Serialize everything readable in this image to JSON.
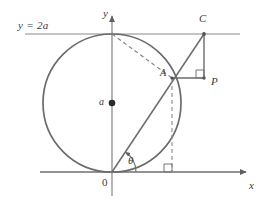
{
  "figure": {
    "type": "geometry-diagram",
    "width": 271,
    "height": 204,
    "background": "#ffffff",
    "stroke_color": "#6e6e6e",
    "axis_color": "#7a7a7a",
    "label_color": "#3a3a3a",
    "dash_color": "#8a8a8a"
  },
  "labels": {
    "line_equation": "y = 2a",
    "y_axis": "y",
    "x_axis": "x",
    "origin": "0",
    "radius": "a",
    "point_a": "A",
    "point_c": "C",
    "point_p": "P",
    "angle": "θ"
  },
  "geometry": {
    "origin": {
      "x": 112,
      "y": 172
    },
    "circle": {
      "cx": 112,
      "cy": 103,
      "r": 69
    },
    "center_dot": {
      "x": 112,
      "y": 103,
      "r": 3.2
    },
    "line_y_eq_2a": {
      "x1": 25,
      "y1": 34,
      "x2": 240,
      "y2": 34
    },
    "x_axis": {
      "x1": 40,
      "y1": 172,
      "x2": 248,
      "y2": 172
    },
    "y_axis": {
      "x1": 112,
      "y1": 196,
      "x2": 112,
      "y2": 14
    },
    "point_top": {
      "x": 112,
      "y": 34
    },
    "point_a": {
      "x": 172,
      "y": 78
    },
    "point_c": {
      "x": 204,
      "y": 34
    },
    "point_p": {
      "x": 204,
      "y": 78
    },
    "ray_o_to_c": {
      "x1": 112,
      "y1": 172,
      "x2": 204,
      "y2": 34
    },
    "segment_a_to_p": {
      "x1": 172,
      "y1": 78,
      "x2": 204,
      "y2": 78
    },
    "segment_c_to_p": {
      "x1": 204,
      "y1": 34,
      "x2": 204,
      "y2": 78
    },
    "dashed_top_to_a": {
      "x1": 112,
      "y1": 34,
      "x2": 172,
      "y2": 78
    },
    "dashed_a_to_axis": {
      "x1": 172,
      "y1": 78,
      "x2": 172,
      "y2": 172
    },
    "right_angle_at_p": {
      "x": 196,
      "y": 70,
      "size": 8
    },
    "right_angle_at_foot": {
      "x": 164,
      "y": 164,
      "size": 8
    },
    "angle_arc": {
      "cx": 112,
      "cy": 172,
      "r": 24,
      "start_deg": 0,
      "end_deg": 56
    }
  }
}
